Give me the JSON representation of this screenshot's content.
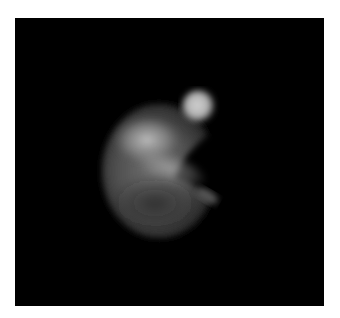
{
  "image": {
    "description": "Grayscale fluorescence-style image of a crescent-shaped glowing object on black background",
    "background_color": "#000000",
    "border_color": "#ffffff",
    "colors": {
      "body": "#5a5a5a",
      "highlight": "#bdbdbd",
      "bud": "#c8c8c8"
    }
  }
}
